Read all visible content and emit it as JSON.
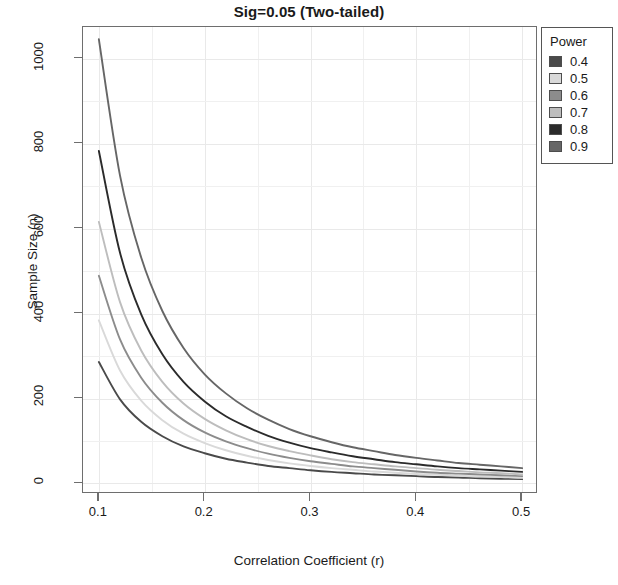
{
  "chart_data": {
    "type": "line",
    "title": "Sig=0.05 (Two-tailed)",
    "xlabel": "Correlation Coefficient (r)",
    "ylabel": "Sample Size (n)",
    "xlim": [
      0.085,
      0.515
    ],
    "ylim": [
      -25,
      1075
    ],
    "xticks": [
      "0.1",
      "0.2",
      "0.3",
      "0.4",
      "0.5"
    ],
    "xtick_values": [
      0.1,
      0.2,
      0.3,
      0.4,
      0.5
    ],
    "yticks": [
      "0",
      "200",
      "400",
      "600",
      "800",
      "1000"
    ],
    "ytick_values": [
      0,
      200,
      400,
      600,
      800,
      1000
    ],
    "grid": true,
    "legend_position": "top-right",
    "legend_title": "Power",
    "x": [
      0.1,
      0.12,
      0.14,
      0.16,
      0.18,
      0.2,
      0.22,
      0.24,
      0.26,
      0.28,
      0.3,
      0.32,
      0.34,
      0.36,
      0.38,
      0.4,
      0.42,
      0.44,
      0.46,
      0.48,
      0.5
    ],
    "series": [
      {
        "name": "0.4",
        "color": "#4a4a4a",
        "values": [
          286,
          198,
          145,
          111,
          87,
          71,
          58,
          49,
          41,
          36,
          31,
          27,
          24,
          21,
          19,
          17,
          15,
          14,
          12,
          11,
          10
        ]
      },
      {
        "name": "0.5",
        "color": "#d9d9d9",
        "values": [
          384,
          266,
          195,
          149,
          117,
          95,
          78,
          65,
          55,
          47,
          41,
          36,
          32,
          28,
          25,
          22,
          20,
          18,
          16,
          15,
          13
        ]
      },
      {
        "name": "0.6",
        "color": "#8c8c8c",
        "values": [
          489,
          339,
          249,
          190,
          149,
          120,
          99,
          83,
          70,
          60,
          52,
          46,
          40,
          36,
          32,
          28,
          25,
          23,
          21,
          19,
          17
        ]
      },
      {
        "name": "0.7",
        "color": "#bdbdbd",
        "values": [
          616,
          427,
          313,
          239,
          188,
          152,
          125,
          104,
          88,
          76,
          66,
          57,
          50,
          45,
          40,
          36,
          32,
          29,
          26,
          24,
          21
        ]
      },
      {
        "name": "0.8",
        "color": "#2b2b2b",
        "values": [
          783,
          543,
          398,
          304,
          239,
          193,
          158,
          133,
          112,
          96,
          83,
          73,
          64,
          57,
          50,
          45,
          40,
          36,
          33,
          30,
          27
        ]
      },
      {
        "name": "0.9",
        "color": "#666666",
        "values": [
          1046,
          725,
          532,
          406,
          319,
          257,
          212,
          177,
          150,
          128,
          111,
          97,
          85,
          76,
          67,
          60,
          54,
          48,
          44,
          40,
          36
        ]
      }
    ]
  },
  "legend": {
    "title": "Power",
    "items": [
      {
        "label": "0.4"
      },
      {
        "label": "0.5"
      },
      {
        "label": "0.6"
      },
      {
        "label": "0.7"
      },
      {
        "label": "0.8"
      },
      {
        "label": "0.9"
      }
    ]
  }
}
